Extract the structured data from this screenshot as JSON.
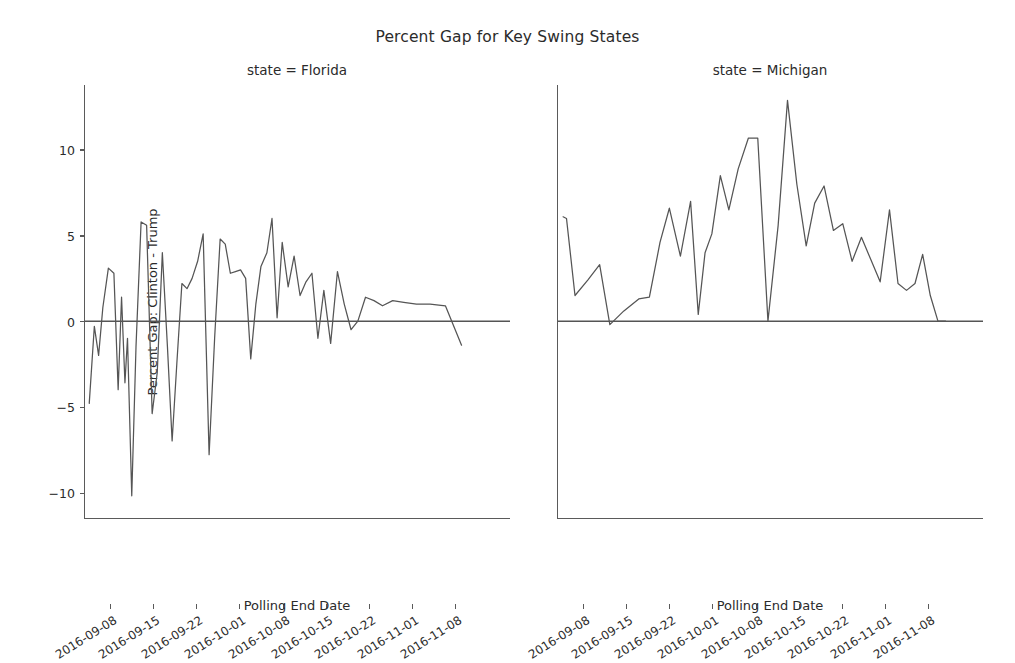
{
  "figure": {
    "suptitle": "Percent Gap for Key Swing States",
    "line_color": "#555555",
    "zero_line_color": "#555555",
    "axis_color": "#5a5a5a",
    "background": "#ffffff"
  },
  "axes": {
    "ylabel": "Percent Gap: Clinton - Trump",
    "xlabel": "Polling End Date",
    "yticks": [
      10,
      5,
      0,
      -5,
      -10
    ],
    "ytick_labels": [
      "10",
      "5",
      "0",
      "−5",
      "−10"
    ],
    "ylim": [
      -11.5,
      13.8
    ],
    "xtick_labels": [
      "2016-09-08",
      "2016-09-15",
      "2016-09-22",
      "2016-10-01",
      "2016-10-08",
      "2016-10-15",
      "2016-10-22",
      "2016-11-01",
      "2016-11-08"
    ],
    "xtick_positions": [
      0.061,
      0.162,
      0.263,
      0.364,
      0.466,
      0.567,
      0.668,
      0.769,
      0.871
    ],
    "grid": false,
    "legend": "none"
  },
  "panels": [
    {
      "id": "florida",
      "title": "state = Florida"
    },
    {
      "id": "michigan",
      "title": "state = Michigan"
    }
  ],
  "chart_data": {
    "type": "line",
    "title": "Percent Gap for Key Swing States",
    "xlabel": "Polling End Date",
    "ylabel": "Percent Gap: Clinton - Trump",
    "ylim": [
      -11.5,
      13.8
    ],
    "grid": false,
    "legend_position": "none",
    "facets": [
      {
        "name": "state = Florida",
        "state": "Florida",
        "x_index": [
          0,
          1,
          2,
          3,
          4,
          5,
          6,
          7,
          8,
          9,
          10,
          11,
          12,
          13,
          14,
          15,
          16,
          17,
          18,
          19,
          20,
          21,
          22,
          23,
          24,
          25,
          26,
          27,
          28,
          29,
          30,
          31,
          32,
          33,
          34,
          35,
          36,
          37,
          38,
          39,
          40,
          41,
          42,
          43,
          44,
          45,
          46,
          47,
          48,
          49,
          50,
          51,
          52,
          53,
          54,
          55,
          56,
          57,
          58,
          59,
          60
        ],
        "x_fraction": [
          0.01,
          0.022,
          0.032,
          0.042,
          0.055,
          0.068,
          0.078,
          0.086,
          0.094,
          0.1,
          0.11,
          0.12,
          0.132,
          0.145,
          0.158,
          0.17,
          0.182,
          0.194,
          0.205,
          0.216,
          0.228,
          0.24,
          0.252,
          0.265,
          0.278,
          0.292,
          0.305,
          0.318,
          0.33,
          0.342,
          0.354,
          0.366,
          0.378,
          0.39,
          0.402,
          0.414,
          0.428,
          0.44,
          0.452,
          0.464,
          0.478,
          0.492,
          0.506,
          0.52,
          0.534,
          0.548,
          0.562,
          0.578,
          0.594,
          0.61,
          0.626,
          0.642,
          0.66,
          0.68,
          0.7,
          0.724,
          0.75,
          0.78,
          0.812,
          0.848,
          0.886
        ],
        "values": [
          -4.8,
          -0.3,
          -2.0,
          0.8,
          3.1,
          2.8,
          -4.0,
          1.4,
          -3.6,
          -1.0,
          -10.2,
          -1.5,
          5.8,
          5.6,
          -5.4,
          -3.0,
          4.0,
          -1.5,
          -7.0,
          -2.5,
          2.2,
          1.9,
          2.5,
          3.5,
          5.1,
          -7.8,
          -1.0,
          4.8,
          4.5,
          2.8,
          2.9,
          3.0,
          2.5,
          -2.2,
          1.0,
          3.2,
          4.0,
          6.0,
          0.2,
          4.6,
          2.0,
          3.8,
          1.5,
          2.3,
          2.8,
          -1.0,
          1.8,
          -1.3,
          2.9,
          1.0,
          -0.5,
          0.0,
          1.4,
          1.2,
          0.9,
          1.2,
          1.1,
          1.0,
          1.0,
          0.9,
          -1.4
        ]
      },
      {
        "name": "state = Michigan",
        "state": "Michigan",
        "x_index": [
          0,
          1,
          2,
          3,
          4,
          5,
          6,
          7,
          8,
          9,
          10,
          11,
          12,
          13,
          14,
          15,
          16,
          17,
          18,
          19,
          20,
          21,
          22,
          23,
          24,
          25,
          26,
          27,
          28,
          29,
          30,
          31,
          32,
          33,
          34,
          35,
          36,
          37,
          38,
          39,
          40,
          41
        ],
        "x_fraction": [
          0.012,
          0.02,
          0.04,
          0.07,
          0.098,
          0.122,
          0.155,
          0.19,
          0.215,
          0.24,
          0.262,
          0.288,
          0.312,
          0.33,
          0.346,
          0.362,
          0.382,
          0.402,
          0.424,
          0.448,
          0.47,
          0.494,
          0.518,
          0.54,
          0.562,
          0.584,
          0.604,
          0.626,
          0.648,
          0.67,
          0.692,
          0.714,
          0.736,
          0.758,
          0.78,
          0.8,
          0.82,
          0.84,
          0.858,
          0.876,
          0.894,
          0.912
        ],
        "values": [
          6.1,
          6.0,
          1.5,
          2.4,
          3.3,
          -0.2,
          0.6,
          1.3,
          1.4,
          4.6,
          6.6,
          3.8,
          7.0,
          0.4,
          4.0,
          5.1,
          8.5,
          6.5,
          8.9,
          10.7,
          10.7,
          0.0,
          5.6,
          12.9,
          8.0,
          4.4,
          6.9,
          7.9,
          5.3,
          5.7,
          3.5,
          4.9,
          3.6,
          2.3,
          6.5,
          2.2,
          1.8,
          2.2,
          3.9,
          1.5,
          0.0,
          0.0
        ]
      }
    ]
  }
}
